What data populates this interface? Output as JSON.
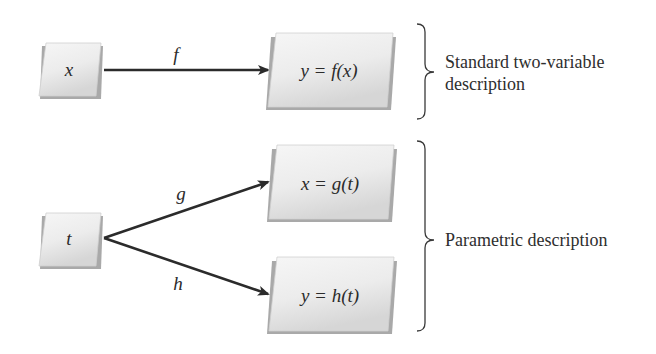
{
  "diagram": {
    "title": "",
    "nodes": {
      "x_input": {
        "label": "x"
      },
      "y_equals_f_of_x": {
        "label": "y = f(x)"
      },
      "t_input": {
        "label": "t"
      },
      "x_equals_g_of_t": {
        "label": "x = g(t)"
      },
      "y_equals_h_of_t": {
        "label": "y = h(t)"
      }
    },
    "edges": {
      "f": {
        "label": "f",
        "from": "x",
        "to": "y = f(x)"
      },
      "g": {
        "label": "g",
        "from": "t",
        "to": "x = g(t)"
      },
      "h": {
        "label": "h",
        "from": "t",
        "to": "y = h(t)"
      }
    },
    "braces": {
      "standard": {
        "line1": "Standard two-variable",
        "line2": "description"
      },
      "parametric": {
        "label": "Parametric description"
      }
    },
    "colors": {
      "box_fill_light": "#f4f4f4",
      "box_fill_dark": "#d8d8d8",
      "box_shadow": "#a9a9a9",
      "arrow": "#2b2b2b",
      "text": "#2b2b2b"
    }
  }
}
